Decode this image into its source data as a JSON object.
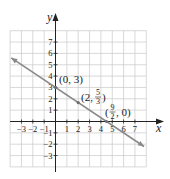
{
  "chart_data": {
    "type": "line",
    "title": "",
    "xlabel": "x",
    "ylabel": "y",
    "xlim": [
      -4,
      8
    ],
    "ylim": [
      -4,
      8
    ],
    "grid": true,
    "x_tick_labels": [
      "-3",
      "-2",
      "-1",
      "1",
      "2",
      "3",
      "4",
      "5",
      "6",
      "7"
    ],
    "y_tick_labels": [
      "7",
      "6",
      "5",
      "4",
      "3",
      "2",
      "1",
      "-1",
      "-2",
      "-3"
    ],
    "series": [
      {
        "name": "y = 3 - (2/3)x",
        "equation": "2x + 3y = 9",
        "color": "#8a8a8a",
        "x": [
          -3.9,
          7.8
        ],
        "y": [
          5.6,
          -2.2
        ],
        "arrows": "both"
      }
    ],
    "annotations": [
      {
        "text": "(0, 3)",
        "x": 0,
        "y": 3
      },
      {
        "text": "(2, 5/3)",
        "x": 2,
        "y": 1.6667,
        "num": "5",
        "den": "3",
        "prefix": "(2, ",
        "suffix": ")"
      },
      {
        "text": "(9/2, 0)",
        "x": 4.5,
        "y": 0,
        "num": "9",
        "den": "2",
        "prefix": "(",
        "suffix": ", 0)"
      }
    ],
    "points": [
      {
        "x": 0,
        "y": 3
      },
      {
        "x": 2,
        "y": 1.6667
      },
      {
        "x": 4.5,
        "y": 0
      }
    ]
  },
  "labels": {
    "x_axis": "x",
    "y_axis": "y",
    "ann1": "(0, 3)",
    "ann2_prefix": "(2, ",
    "ann2_num": "5",
    "ann2_den": "3",
    "ann2_suffix": ")",
    "ann3_prefix": "(",
    "ann3_num": "9",
    "ann3_den": "2",
    "ann3_suffix": ", 0)"
  },
  "colors": {
    "grid": "#c8c8c8",
    "axis": "#222222",
    "line": "#8a8a8a",
    "text": "#222222"
  }
}
